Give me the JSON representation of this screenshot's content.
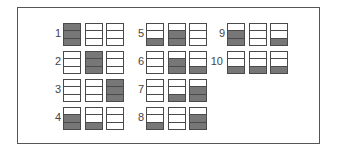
{
  "diagram": {
    "fill_color": "#777777",
    "border_color": "#4a4a4a",
    "patterns": [
      {
        "label": "1",
        "boxes": [
          [
            1,
            1,
            1
          ],
          [
            0,
            0,
            0
          ],
          [
            0,
            0,
            0
          ]
        ]
      },
      {
        "label": "2",
        "boxes": [
          [
            0,
            0,
            0
          ],
          [
            1,
            1,
            1
          ],
          [
            0,
            0,
            0
          ]
        ]
      },
      {
        "label": "3",
        "boxes": [
          [
            0,
            0,
            0
          ],
          [
            0,
            0,
            0
          ],
          [
            1,
            1,
            1
          ]
        ]
      },
      {
        "label": "4",
        "boxes": [
          [
            0,
            1,
            1
          ],
          [
            0,
            0,
            1
          ],
          [
            0,
            0,
            0
          ]
        ]
      },
      {
        "label": "5",
        "boxes": [
          [
            0,
            0,
            1
          ],
          [
            0,
            1,
            1
          ],
          [
            0,
            0,
            0
          ]
        ]
      },
      {
        "label": "6",
        "boxes": [
          [
            0,
            0,
            0
          ],
          [
            0,
            1,
            1
          ],
          [
            0,
            0,
            1
          ]
        ]
      },
      {
        "label": "7",
        "boxes": [
          [
            0,
            0,
            0
          ],
          [
            0,
            0,
            1
          ],
          [
            0,
            1,
            1
          ]
        ]
      },
      {
        "label": "8",
        "boxes": [
          [
            0,
            0,
            1
          ],
          [
            0,
            0,
            0
          ],
          [
            0,
            1,
            1
          ]
        ]
      },
      {
        "label": "9",
        "boxes": [
          [
            0,
            1,
            1
          ],
          [
            0,
            0,
            0
          ],
          [
            0,
            0,
            1
          ]
        ]
      },
      {
        "label": "10",
        "boxes": [
          [
            0,
            0,
            1
          ],
          [
            0,
            0,
            1
          ],
          [
            0,
            0,
            1
          ]
        ]
      }
    ]
  }
}
